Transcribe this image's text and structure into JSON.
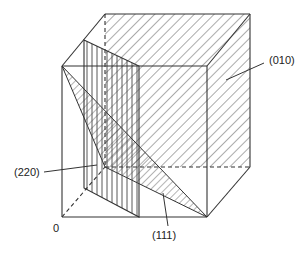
{
  "figure": {
    "colors": {
      "line": "#333333",
      "hatch": "#444444",
      "background": "#ffffff"
    },
    "labels": {
      "plane_010": "(010)",
      "plane_220": "(220)",
      "plane_111": "(111)",
      "origin": "0"
    },
    "planes": [
      {
        "id": "010",
        "hatch": "diagonal",
        "label": "(010)"
      },
      {
        "id": "220",
        "hatch": "vertical",
        "label": "(220)"
      },
      {
        "id": "111",
        "hatch": "diagonal-fine",
        "label": "(111)"
      }
    ]
  }
}
